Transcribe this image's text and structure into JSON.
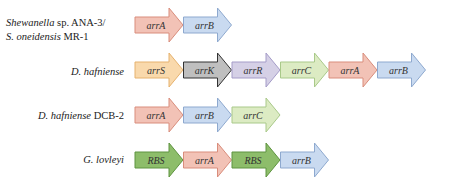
{
  "colors": {
    "arrA": {
      "fill": "#f2c2b6",
      "stroke": "#d98d7c"
    },
    "arrB": {
      "fill": "#c9daf0",
      "stroke": "#8ea9cf"
    },
    "arrC": {
      "fill": "#dcebc3",
      "stroke": "#a9c98a"
    },
    "arrS": {
      "fill": "#f9d9ac",
      "stroke": "#e6b26e"
    },
    "arrK": {
      "fill": "#bfbfbf",
      "stroke": "#333333"
    },
    "arrR": {
      "fill": "#d5d0e6",
      "stroke": "#a59cc8"
    },
    "RBS": {
      "fill": "#8dbd6a",
      "stroke": "#5f9440"
    }
  },
  "rows": [
    {
      "organism_line1_italic": "Shewanella",
      "organism_line1_rest": " sp. ANA-3/",
      "organism_line2_italic": "S. oneidensis",
      "organism_line2_rest": " MR-1",
      "genes": [
        "arrA",
        "arrB"
      ]
    },
    {
      "organism_italic": "D. hafniense",
      "organism_rest": "",
      "genes": [
        "arrS",
        "arrK",
        "arrR",
        "arrC",
        "arrA",
        "arrB"
      ]
    },
    {
      "organism_italic": "D. hafniense",
      "organism_rest": " DCB-2",
      "genes": [
        "arrA",
        "arrB",
        "arrC"
      ]
    },
    {
      "organism_italic": "G. lovleyi",
      "organism_rest": "",
      "genes": [
        "RBS",
        "arrA",
        "RBS",
        "arrB"
      ]
    }
  ]
}
